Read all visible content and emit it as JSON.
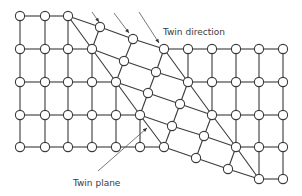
{
  "figure": {
    "type": "crystal twinning schematic",
    "labels": {
      "twin_direction": "Twin direction",
      "twin_plane": "Twin plane"
    },
    "colors": {
      "line": "#3a3a3a",
      "atom_fill": "#ffffff",
      "background": "#ffffff"
    },
    "regions": [
      {
        "name": "parent-lattice-left",
        "description": "square lattice, upper-left of twin"
      },
      {
        "name": "twinned-region",
        "description": "sheared lattice between twin planes"
      },
      {
        "name": "parent-lattice-right",
        "description": "square lattice, lower-right of twin"
      }
    ],
    "twin_direction_arrow_count": 3
  }
}
